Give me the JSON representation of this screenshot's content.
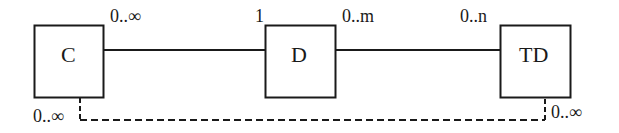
{
  "diagram": {
    "type": "entity-relationship",
    "colors": {
      "stroke": "#1a1a1a",
      "background": "#ffffff"
    },
    "entities": [
      {
        "id": "C",
        "label": "C"
      },
      {
        "id": "D",
        "label": "D"
      },
      {
        "id": "TD",
        "label": "TD"
      }
    ],
    "relationships": [
      {
        "from": "C",
        "to": "D",
        "style": "solid",
        "from_multiplicity": "0..∞",
        "to_multiplicity": "1"
      },
      {
        "from": "D",
        "to": "TD",
        "style": "solid",
        "from_multiplicity": "0..m",
        "to_multiplicity": "0..n"
      },
      {
        "from": "C",
        "to": "TD",
        "style": "dashed",
        "from_multiplicity": "0..∞",
        "to_multiplicity": "0..∞"
      }
    ]
  }
}
